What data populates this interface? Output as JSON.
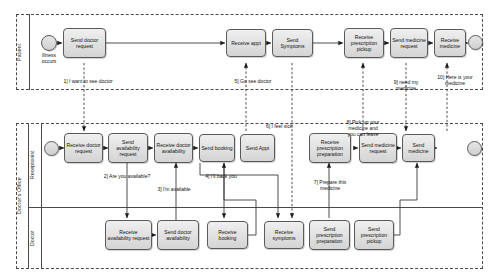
{
  "diagram": {
    "type": "bpmn-collaboration"
  },
  "colors": {
    "task_fill_top": "#efefef",
    "task_fill_bottom": "#d4d4d4",
    "stroke": "#5a5a5a",
    "pool_border": "#4a4a4a",
    "text": "#111111"
  },
  "pools": [
    {
      "id": "patient",
      "label": "Patient"
    },
    {
      "id": "office",
      "label": "Doctor's Office"
    }
  ],
  "lanes": [
    {
      "id": "receptionist",
      "label": "Receptionist"
    },
    {
      "id": "doctor",
      "label": "Doctor"
    }
  ],
  "events": [
    {
      "id": "p-start",
      "lane": "patient",
      "kind": "start",
      "label": "Illness\noccurs"
    },
    {
      "id": "p-end",
      "lane": "patient",
      "kind": "end",
      "label": ""
    },
    {
      "id": "r-start",
      "lane": "receptionist",
      "kind": "start",
      "label": ""
    },
    {
      "id": "r-end",
      "lane": "receptionist",
      "kind": "end",
      "label": ""
    }
  ],
  "tasks": {
    "patient": [
      {
        "id": "p1",
        "label": "Send\ndoctor\nrequest"
      },
      {
        "id": "p2",
        "label": "Receive\nappt"
      },
      {
        "id": "p3",
        "label": "Send\nSymptoms"
      },
      {
        "id": "p4",
        "label": "Receive\nprescription\npickup"
      },
      {
        "id": "p5",
        "label": "Send\nmedicine\nrequest"
      },
      {
        "id": "p6",
        "label": "Receive\nmedicine"
      }
    ],
    "receptionist": [
      {
        "id": "r1",
        "label": "Receive\ndoctor\nrequest"
      },
      {
        "id": "r2",
        "label": "Send\navailability\nrequest"
      },
      {
        "id": "r3",
        "label": "Receive\ndoctor\navailability"
      },
      {
        "id": "r4",
        "label": "Send\nbooking"
      },
      {
        "id": "r5",
        "label": "Send\nAppt"
      },
      {
        "id": "r6",
        "label": "Receive\nprescription\npreparation"
      },
      {
        "id": "r7",
        "label": "Send\nmedicine\nrequest"
      },
      {
        "id": "r8",
        "label": "Send\nmedicine"
      }
    ],
    "doctor": [
      {
        "id": "d1",
        "label": "Receive\navailability\nrequest"
      },
      {
        "id": "d2",
        "label": "Send\ndoctor\navailability"
      },
      {
        "id": "d3",
        "label": "Receive\nbooking"
      },
      {
        "id": "d4",
        "label": "Receive\nsymptoms"
      },
      {
        "id": "d5",
        "label": "Send\nprescription\npreparation"
      },
      {
        "id": "d6",
        "label": "Send\nprescription\npickup"
      }
    ]
  },
  "messages": [
    {
      "n": "1",
      "text": "1] I want to see doctor"
    },
    {
      "n": "2",
      "text": "2] Are you available?"
    },
    {
      "n": "3",
      "text": "3] I'm available"
    },
    {
      "n": "4",
      "text": "4] I'll back you"
    },
    {
      "n": "5",
      "text": "5] Go see doctor"
    },
    {
      "n": "6",
      "text": "6] I feel sick"
    },
    {
      "n": "7",
      "text": "7] Prepare this\nmedicine"
    },
    {
      "n": "8",
      "text": "8] Pick up your\nmedicine and\nyou can leave"
    },
    {
      "n": "9",
      "text": "9] need my\nmedicine"
    },
    {
      "n": "10",
      "text": "10] Here is your\nmedicine"
    }
  ]
}
